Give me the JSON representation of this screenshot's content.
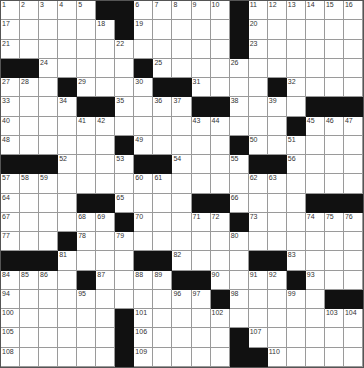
{
  "puzzle": {
    "rows": 19,
    "cols": 19,
    "colors": {
      "block": "#111111",
      "cell": "#ffffff",
      "gridline": "#9a9a9a"
    },
    "grid": [
      "1,2,3,4,5,#,#,6,7,8,9,10,#,11,12,13,14,15,16",
      "17,.,.,.,.,18,#,19,.,.,.,.,#,20,.,.,.,.,.",
      "21,.,.,.,.,.,22,.,.,.,.,.,#,23,.,.,.,.,.",
      "#,#,24,.,.,.,.,#,25,.,.,.,26,.,.,.,.,.,.",
      "27,28,.,#,29,.,.,30,#,#,31,.,.,.,#,32,.,.,.",
      "33,.,.,34,#,#,35,.,36,37,#,#,38,.,39,.,#,#,#",
      "40,.,.,.,41,42,.,.,.,.,43,44,.,.,.,#,45,46,47",
      "48,.,.,.,.,.,#,49,.,.,.,.,#,50,.,51,.,.,.",
      "#,#,#,52,.,.,53,#,#,54,.,.,55,#,#,56,.,.,.",
      "57,58,59,.,.,.,.,60,61,.,.,.,.,62,63,.,.,.,.",
      "64,.,.,.,#,#,65,.,.,.,#,#,66,.,.,.,#,#,#",
      "67,.,.,.,68,69,#,70,.,.,71,72,#,73,.,.,74,75,76",
      "77,.,.,#,78,.,79,.,.,.,.,.,80,.,.,.,.,.,.",
      "#,#,#,81,.,.,.,#,#,82,.,.,.,#,#,83,.,.,.",
      "84,85,86,.,#,87,.,88,89,#,#,90,.,91,92,#,93,.,.",
      "94,.,.,.,95,.,.,.,.,96,97,#,98,.,.,99,.,#,#",
      "100,.,.,.,.,.,#,101,.,.,.,102,.,.,.,.,.,103,104",
      "105,.,.,.,.,.,#,106,.,.,.,.,#,107,.,.,.,.,.",
      "108,.,.,.,.,.,#,109,.,.,.,.,#,#,110,.,.,.,."
    ]
  }
}
